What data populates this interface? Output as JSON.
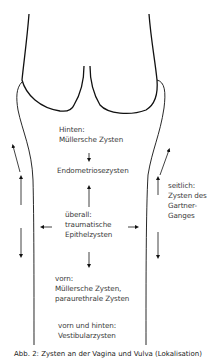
{
  "diagram": {
    "colors": {
      "line": "#111111",
      "text": "#3a3a3a",
      "background": "#ffffff"
    },
    "regions": {
      "posterior": {
        "heading": "Hinten:",
        "text": "Müllersche Zysten"
      },
      "endometriosis": {
        "text": "Endometriosezysten"
      },
      "everywhere": {
        "heading": "überall:",
        "line1": "traumatische",
        "line2": "Epithelzysten"
      },
      "lateral": {
        "heading": "seitlich:",
        "line1": "Zysten des",
        "line2": "Gartner-",
        "line3": "Ganges"
      },
      "anterior": {
        "heading": "vorn:",
        "line1": "Müllersche Zysten,",
        "line2": "paraurethrale Zysten"
      },
      "anterior_posterior": {
        "heading": "vorn und hinten:",
        "text": "Vestibularzysten"
      }
    },
    "caption": "Abb. 2: Zysten an der Vagina und Vulva (Lokalisation)"
  }
}
